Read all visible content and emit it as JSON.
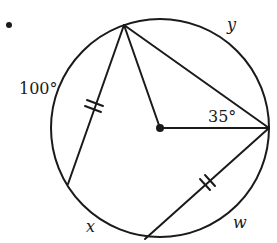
{
  "figure": {
    "type": "circle-geometry",
    "bullet": "•",
    "circle": {
      "cx": 160,
      "cy": 128,
      "r": 109
    },
    "center_point": {
      "x": 160,
      "y": 128
    },
    "points": {
      "top": {
        "x": 124,
        "y": 25
      },
      "right": {
        "x": 269,
        "y": 128
      },
      "bottom": {
        "x": 145,
        "y": 239
      },
      "left": {
        "x": 68,
        "y": 184
      }
    },
    "segments": [
      {
        "name": "chord-top-left",
        "from": "top",
        "to": "left",
        "tick_marks": 2
      },
      {
        "name": "chord-top-right",
        "from": "top",
        "to": "right",
        "tick_marks": 0
      },
      {
        "name": "radius-top",
        "from": "top",
        "to": "center",
        "tick_marks": 0
      },
      {
        "name": "radius-right",
        "from": "center",
        "to": "right",
        "tick_marks": 0
      },
      {
        "name": "chord-right-bottom",
        "from": "right",
        "to": "bottom",
        "tick_marks": 2
      }
    ],
    "labels": {
      "arc_left": "100°",
      "arc_top_right": "y",
      "angle_right": "35°",
      "arc_bottom_left": "x",
      "arc_bottom_right": "w"
    },
    "colors": {
      "stroke": "#1a1a1a",
      "background": "#ffffff"
    }
  }
}
